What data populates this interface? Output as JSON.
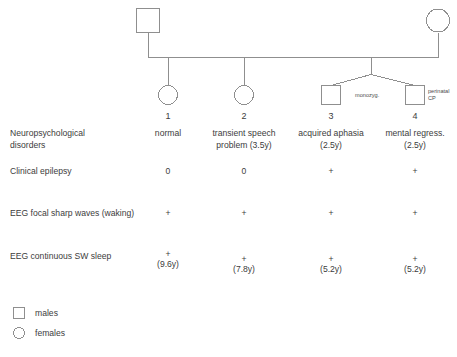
{
  "figure": {
    "type": "pedigree-chart",
    "stroke_color": "#8f8f8f",
    "text_color": "#3c3c3c"
  },
  "generation1": {
    "father": {
      "symbol": "square",
      "sex": "male"
    },
    "mother": {
      "symbol": "circle",
      "sex": "female"
    }
  },
  "twin_annotation": {
    "zygosity": "monozyg.",
    "note_line1": "perinatal",
    "note_line2": "CP"
  },
  "children": [
    {
      "id": "1",
      "symbol": "circle",
      "sex": "female"
    },
    {
      "id": "2",
      "symbol": "circle",
      "sex": "female"
    },
    {
      "id": "3",
      "symbol": "square",
      "sex": "male"
    },
    {
      "id": "4",
      "symbol": "square",
      "sex": "male"
    }
  ],
  "rows": [
    {
      "label_line1": "Neuropsychological",
      "label_line2": "disorders",
      "values": [
        {
          "line1": "normal",
          "line2": ""
        },
        {
          "line1": "transient speech",
          "line2": "problem (3.5y)"
        },
        {
          "line1": "acquired aphasia",
          "line2": "(2.5y)"
        },
        {
          "line1": "mental regress.",
          "line2": "(2.5y)"
        }
      ]
    },
    {
      "label_line1": "Clinical epilepsy",
      "label_line2": "",
      "values": [
        {
          "line1": "0",
          "line2": ""
        },
        {
          "line1": "0",
          "line2": ""
        },
        {
          "line1": "+",
          "line2": ""
        },
        {
          "line1": "+",
          "line2": ""
        }
      ]
    },
    {
      "label_line1": "EEG focal sharp waves (waking)",
      "label_line2": "",
      "values": [
        {
          "line1": "+",
          "line2": ""
        },
        {
          "line1": "+",
          "line2": ""
        },
        {
          "line1": "+",
          "line2": ""
        },
        {
          "line1": "+",
          "line2": ""
        }
      ]
    },
    {
      "label_line1": "EEG continuous SW sleep",
      "label_line2": "",
      "values": [
        {
          "line1": "+",
          "line2": "(9.6y)"
        },
        {
          "line1": "+",
          "line2": "(7.8y)"
        },
        {
          "line1": "+",
          "line2": "(5.2y)"
        },
        {
          "line1": "+",
          "line2": "(5.2y)"
        }
      ]
    }
  ],
  "legend": [
    {
      "symbol": "square",
      "label": "males"
    },
    {
      "symbol": "circle",
      "label": "females"
    }
  ]
}
